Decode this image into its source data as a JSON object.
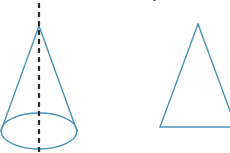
{
  "canvas": {
    "width": 230,
    "height": 153,
    "background": "#ffffff"
  },
  "style": {
    "stroke_blue": "#4a92b8",
    "stroke_blue_light": "#6aa9c6",
    "axis_dash_color": "#2b2b2b",
    "stroke_width": 1.4,
    "axis_stroke_width": 2.2,
    "dash_pattern": "5,4"
  },
  "figures": [
    {
      "id": "cone",
      "label": "cone-with-axis",
      "apex": {
        "x": 39,
        "y": 26
      },
      "base_ellipse": {
        "cx": 39,
        "cy": 131,
        "rx": 38,
        "ry": 18
      },
      "left_slant": {
        "x1": 39,
        "y1": 26,
        "x2": 1,
        "y2": 131
      },
      "right_slant": {
        "x1": 39,
        "y1": 26,
        "x2": 77,
        "y2": 131
      },
      "axis": {
        "x": 39,
        "y1": 3,
        "y2": 152,
        "dashed": true
      }
    },
    {
      "id": "triangle",
      "label": "triangle-outline",
      "apex": {
        "x": 198,
        "y": 24
      },
      "base_left": {
        "x": 160,
        "y": 127
      },
      "base_right": {
        "x": 236,
        "y": 127
      }
    }
  ],
  "cropped_text": {
    "fragment": "T",
    "x": 151,
    "y": -8
  }
}
